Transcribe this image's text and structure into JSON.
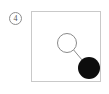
{
  "panel": {
    "label": "4",
    "label_icon": "circled-number-badge",
    "background_color": "#ffffff",
    "frame": {
      "border_color": "#c9c9c9",
      "fill_color": "#ffffff",
      "x": 31,
      "y": 11,
      "width": 70,
      "height": 71
    }
  },
  "diagram": {
    "type": "node-link",
    "nodes": [
      {
        "id": "node-open",
        "name": "open-circle-node",
        "fill": "#ffffff",
        "stroke": "#8a8a8a",
        "stroke_width": 1,
        "cx": 35,
        "cy": 31,
        "r": 9.5
      },
      {
        "id": "node-filled",
        "name": "filled-circle-node",
        "fill": "#0d0d0d",
        "stroke": "#0d0d0d",
        "stroke_width": 0,
        "cx": 57,
        "cy": 56,
        "r": 11
      }
    ],
    "edges": [
      {
        "id": "edge-1",
        "name": "node-connector-line",
        "from": "node-open",
        "to": "node-filled",
        "x1": 41.5,
        "y1": 37.8,
        "x2": 50.5,
        "y2": 48.5,
        "stroke": "#8a8a8a",
        "stroke_width": 1
      }
    ]
  }
}
